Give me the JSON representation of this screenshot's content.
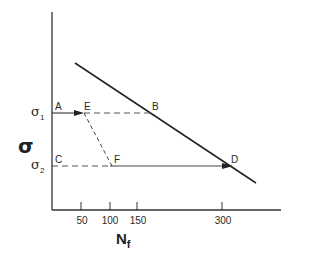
{
  "diagram": {
    "y_axis_label": "σ",
    "x_axis_label": {
      "main": "N",
      "sub": "f"
    },
    "stress_levels": [
      {
        "label": "σ",
        "sub": "1",
        "y": 113
      },
      {
        "label": "σ",
        "sub": "2",
        "y": 166
      }
    ],
    "points": {
      "A": {
        "label": "A"
      },
      "B": {
        "label": "B"
      },
      "C": {
        "label": "C"
      },
      "D": {
        "label": "D"
      },
      "E": {
        "label": "E"
      },
      "F": {
        "label": "F"
      }
    },
    "x_ticks": [
      {
        "label": "50",
        "x": 81
      },
      {
        "label": "100",
        "x": 110
      },
      {
        "label": "150",
        "x": 137
      },
      {
        "label": "300",
        "x": 222
      }
    ],
    "colors": {
      "line": "#222222",
      "background": "#ffffff"
    }
  }
}
